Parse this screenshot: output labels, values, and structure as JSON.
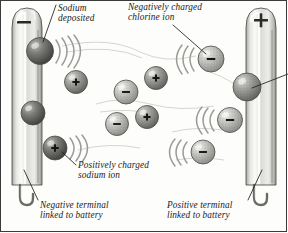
{
  "figure": {
    "type": "scientific-illustration",
    "background_color": "#fdfdfc",
    "border_color": "#3a3a3a",
    "ink_color": "#1b1b1b"
  },
  "electrodes": [
    {
      "id": "left",
      "name": "negative-electrode",
      "polarity_symbol": "−",
      "polarity_name": "minus-sign",
      "caption_line1": "Negative terminal",
      "caption_line2": "linked to battery",
      "body_color": "#d8d8d4",
      "highlight_color": "#f6f6f4",
      "shadow_color": "#9a9a96"
    },
    {
      "id": "right",
      "name": "positive-electrode",
      "polarity_symbol": "+",
      "polarity_name": "plus-sign",
      "caption_line1": "Positive terminal",
      "caption_line2": "linked to battery",
      "body_color": "#d8d8d4",
      "highlight_color": "#f6f6f4",
      "shadow_color": "#9a9a96"
    }
  ],
  "callouts": {
    "sodium_deposited": {
      "line1": "Sodium",
      "line2": "deposited"
    },
    "chlorine_ion": {
      "line1": "Negatively charged",
      "line2": "chlorine ion"
    },
    "sodium_ion": {
      "line1": "Positively charged",
      "line2": "sodium ion"
    }
  },
  "ions": [
    {
      "id": "na-deposited-1",
      "name": "sodium-atom-deposited-upper",
      "charge": "",
      "cx": 40,
      "cy": 51,
      "r": 13.5,
      "tone": "dark",
      "fill": "#5a5a58",
      "motion": "right"
    },
    {
      "id": "na-deposited-2",
      "name": "sodium-atom-deposited-lower",
      "charge": "",
      "cx": 33,
      "cy": 113,
      "r": 12,
      "tone": "dark",
      "fill": "#5d5d5b",
      "motion": "none"
    },
    {
      "id": "na-ion-1",
      "name": "sodium-ion-mid-left",
      "charge": "+",
      "cx": 76,
      "cy": 82,
      "r": 11.5,
      "tone": "medium",
      "fill": "#8b8b88",
      "motion": "none"
    },
    {
      "id": "na-ion-2",
      "name": "sodium-ion-lower-left",
      "charge": "+",
      "cx": 55,
      "cy": 148,
      "r": 12,
      "tone": "dark",
      "fill": "#6e6e6b",
      "motion": "right"
    },
    {
      "id": "na-ion-3",
      "name": "sodium-ion-center-upper",
      "charge": "+",
      "cx": 156,
      "cy": 78,
      "r": 11.5,
      "tone": "medium",
      "fill": "#8d8d8a",
      "motion": "none"
    },
    {
      "id": "na-ion-4",
      "name": "sodium-ion-center-lower",
      "charge": "+",
      "cx": 147,
      "cy": 117,
      "r": 11.5,
      "tone": "medium",
      "fill": "#8a8a87",
      "motion": "none"
    },
    {
      "id": "cl-ion-1",
      "name": "chlorine-ion-center-upper",
      "charge": "−",
      "cx": 126,
      "cy": 92,
      "r": 12,
      "tone": "light",
      "fill": "#b8b8b4",
      "motion": "none"
    },
    {
      "id": "cl-ion-2",
      "name": "chlorine-ion-center-lower",
      "charge": "−",
      "cx": 117,
      "cy": 124,
      "r": 11.5,
      "tone": "light",
      "fill": "#bdbdb9",
      "motion": "none"
    },
    {
      "id": "cl-ion-3",
      "name": "chlorine-ion-upper-right",
      "charge": "−",
      "cx": 211,
      "cy": 59,
      "r": 13,
      "tone": "light",
      "fill": "#b0b0ac",
      "motion": "left"
    },
    {
      "id": "cl-ion-4",
      "name": "chlorine-ion-right-mid",
      "charge": "−",
      "cx": 230,
      "cy": 120,
      "r": 12.5,
      "tone": "light",
      "fill": "#b4b4b0",
      "motion": "left"
    },
    {
      "id": "cl-ion-5",
      "name": "chlorine-ion-lower-right",
      "charge": "−",
      "cx": 203,
      "cy": 152,
      "r": 12,
      "tone": "light",
      "fill": "#b6b6b2",
      "motion": "left"
    },
    {
      "id": "cl-discharged",
      "name": "chlorine-atom-at-anode",
      "charge": "",
      "cx": 247,
      "cy": 87,
      "r": 14,
      "tone": "medium",
      "fill": "#9c9c98",
      "motion": "none"
    }
  ],
  "colors": {
    "electrode_light": "#f3f3f1",
    "electrode_mid": "#d4d4d0",
    "electrode_dark": "#a3a39f",
    "outline": "#4a4a48",
    "motion_arc": "#9b9b97"
  }
}
